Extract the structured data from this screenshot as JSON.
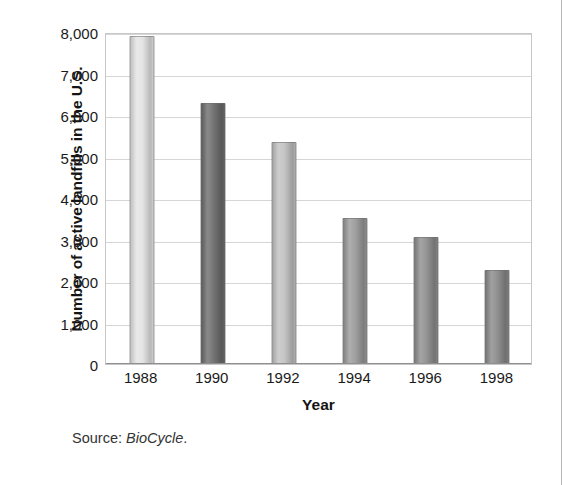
{
  "chart_data": {
    "type": "bar",
    "title": "",
    "xlabel": "Year",
    "ylabel": "Number of active landfills in the U.S.",
    "categories": [
      "1988",
      "1990",
      "1992",
      "1994",
      "1996",
      "1998"
    ],
    "values": [
      7900,
      6300,
      5350,
      3520,
      3050,
      2270
    ],
    "ylim": [
      0,
      8000
    ],
    "ytick_values": [
      0,
      1000,
      2000,
      3000,
      4000,
      5000,
      6000,
      7000,
      8000
    ],
    "ytick_labels": [
      "0",
      "1,000",
      "2,000",
      "3,000",
      "4,000",
      "5,000",
      "6,000",
      "7,000",
      "8,000"
    ],
    "grid": "horizontal",
    "legend": "none",
    "bar_colors": [
      "#e3e3e3",
      "#6d6d6d",
      "#c2c2c2",
      "#9a9a9a",
      "#8e8e8e",
      "#8a8a8a"
    ]
  },
  "caption": {
    "source_prefix": "Source:",
    "source_name": "BioCycle",
    "source_suffix": "."
  }
}
